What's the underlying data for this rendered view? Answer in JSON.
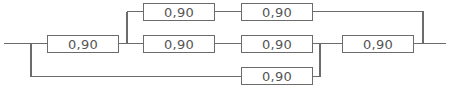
{
  "diagram": {
    "type": "reliability-block-diagram",
    "colors": {
      "line": "#6b6b6b",
      "text": "#555555",
      "background": "#ffffff"
    },
    "blocks": [
      {
        "id": "A",
        "label": "0,90",
        "x": 47,
        "y": 35,
        "w": 72,
        "h": 18
      },
      {
        "id": "B",
        "label": "0,90",
        "x": 143,
        "y": 3,
        "w": 72,
        "h": 18
      },
      {
        "id": "C",
        "label": "0,90",
        "x": 241,
        "y": 3,
        "w": 72,
        "h": 18
      },
      {
        "id": "D",
        "label": "0,90",
        "x": 143,
        "y": 35,
        "w": 72,
        "h": 18
      },
      {
        "id": "E",
        "label": "0,90",
        "x": 241,
        "y": 35,
        "w": 72,
        "h": 18
      },
      {
        "id": "F",
        "label": "0,90",
        "x": 342,
        "y": 35,
        "w": 72,
        "h": 18
      },
      {
        "id": "G",
        "label": "0,90",
        "x": 241,
        "y": 67,
        "w": 72,
        "h": 18
      }
    ]
  }
}
